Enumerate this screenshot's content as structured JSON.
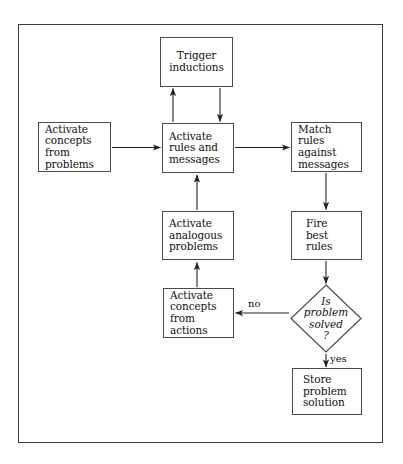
{
  "diagram": {
    "type": "flowchart",
    "frame": {
      "stroke": "#3a3a3a"
    },
    "colors": {
      "box_stroke": "#4a4a4a",
      "text": "#111111",
      "arrow": "#222222",
      "background": "#ffffff"
    },
    "nodes": [
      {
        "id": "trigger-inductions",
        "shape": "rect",
        "label": "Trigger\ninductions",
        "x": 160,
        "y": 37,
        "w": 73,
        "h": 50,
        "align": "center"
      },
      {
        "id": "activate-concepts-problems",
        "shape": "rect",
        "label": "Activate\nconcepts\nfrom\nproblems",
        "x": 38,
        "y": 122,
        "w": 73,
        "h": 50,
        "align": "left"
      },
      {
        "id": "activate-rules-messages",
        "shape": "rect",
        "label": "Activate\nrules and\nmessages",
        "x": 162,
        "y": 123,
        "w": 72,
        "h": 50,
        "align": "left"
      },
      {
        "id": "match-rules-messages",
        "shape": "rect",
        "label": "Match\nrules\nagainst\nmessages",
        "x": 291,
        "y": 122,
        "w": 71,
        "h": 50,
        "align": "left"
      },
      {
        "id": "activate-analogous-problems",
        "shape": "rect",
        "label": "Activate\nanalogous\nproblems",
        "x": 162,
        "y": 211,
        "w": 72,
        "h": 49,
        "align": "left"
      },
      {
        "id": "fire-best-rules",
        "shape": "rect",
        "label": "Fire\nbest\nrules",
        "x": 291,
        "y": 211,
        "w": 71,
        "h": 49,
        "align": "left"
      },
      {
        "id": "activate-concepts-actions",
        "shape": "rect",
        "label": "Activate\nconcepts\nfrom\nactions",
        "x": 163,
        "y": 288,
        "w": 71,
        "h": 50,
        "align": "left"
      },
      {
        "id": "is-problem-solved",
        "shape": "diamond",
        "label": "Is\nproblem\nsolved\n?",
        "x": 290,
        "y": 284,
        "w": 72,
        "h": 69,
        "italic": true
      },
      {
        "id": "store-problem-solution",
        "shape": "rect",
        "label": "Store\nproblem\nsolution",
        "x": 292,
        "y": 368,
        "w": 70,
        "h": 47,
        "align": "left"
      }
    ],
    "edges": [
      {
        "id": "edge-concepts-to-rules",
        "from": "activate-concepts-problems",
        "to": "activate-rules-messages",
        "label": "",
        "direction": "right"
      },
      {
        "id": "edge-rules-to-match",
        "from": "activate-rules-messages",
        "to": "match-rules-messages",
        "label": "",
        "direction": "right"
      },
      {
        "id": "edge-rules-to-trigger",
        "from": "activate-rules-messages",
        "to": "trigger-inductions",
        "label": "",
        "direction": "up"
      },
      {
        "id": "edge-trigger-to-rules",
        "from": "trigger-inductions",
        "to": "activate-rules-messages",
        "label": "",
        "direction": "down"
      },
      {
        "id": "edge-analogous-to-rules",
        "from": "activate-analogous-problems",
        "to": "activate-rules-messages",
        "label": "",
        "direction": "up"
      },
      {
        "id": "edge-match-to-fire",
        "from": "match-rules-messages",
        "to": "fire-best-rules",
        "label": "",
        "direction": "down"
      },
      {
        "id": "edge-fire-to-decision",
        "from": "fire-best-rules",
        "to": "is-problem-solved",
        "label": "",
        "direction": "down"
      },
      {
        "id": "edge-decision-to-concepts-actions",
        "from": "is-problem-solved",
        "to": "activate-concepts-actions",
        "label": "no",
        "direction": "left"
      },
      {
        "id": "edge-concepts-actions-to-analogous",
        "from": "activate-concepts-actions",
        "to": "activate-analogous-problems",
        "label": "",
        "direction": "up"
      },
      {
        "id": "edge-decision-to-store",
        "from": "is-problem-solved",
        "to": "store-problem-solution",
        "label": "yes",
        "direction": "down"
      }
    ],
    "edge_labels": {
      "no": "no",
      "yes": "yes"
    }
  }
}
